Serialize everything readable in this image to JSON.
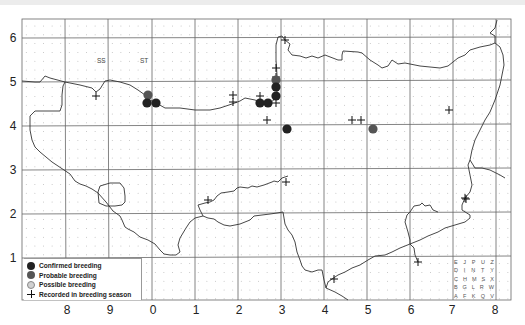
{
  "map": {
    "title": "Breeding distribution map",
    "square_labels": [
      {
        "text": "SS",
        "x": 97,
        "y": 57
      },
      {
        "text": "ST",
        "x": 140,
        "y": 57
      }
    ],
    "y_axis_labels": [
      {
        "text": "6",
        "y": 38
      },
      {
        "text": "5",
        "y": 82
      },
      {
        "text": "4",
        "y": 126
      },
      {
        "text": "3",
        "y": 170
      },
      {
        "text": "2",
        "y": 214
      },
      {
        "text": "1",
        "y": 258
      }
    ],
    "x_axis_labels": [
      {
        "text": "8",
        "x": 67
      },
      {
        "text": "9",
        "x": 110
      },
      {
        "text": "0",
        "x": 153
      },
      {
        "text": "1",
        "x": 196
      },
      {
        "text": "2",
        "x": 239
      },
      {
        "text": "3",
        "x": 282
      },
      {
        "text": "4",
        "x": 325
      },
      {
        "text": "5",
        "x": 368
      },
      {
        "text": "6",
        "x": 411
      },
      {
        "text": "7",
        "x": 452
      },
      {
        "text": "8",
        "x": 495
      }
    ],
    "colors": {
      "confirmed": "#222222",
      "probable": "#555555",
      "possible": "#c8c8c8",
      "grid": "#555555",
      "dots": "#bbbbbb",
      "coast": "#333333"
    }
  },
  "legend": {
    "items": [
      {
        "symbol": "filled-dark-circle",
        "label": "Confirmed breeding"
      },
      {
        "symbol": "filled-grey-circle",
        "label": "Probable breeding"
      },
      {
        "symbol": "light-grey-circle",
        "label": "Possible breeding"
      },
      {
        "symbol": "plus",
        "label": "Recorded in breeding season"
      }
    ]
  },
  "tetrad_key": {
    "rows": [
      [
        "E",
        "J",
        "P",
        "U",
        "Z"
      ],
      [
        "D",
        "I",
        "N",
        "T",
        "Y"
      ],
      [
        "C",
        "H",
        "M",
        "S",
        "X"
      ],
      [
        "B",
        "G",
        "L",
        "R",
        "W"
      ],
      [
        "A",
        "F",
        "K",
        "Q",
        "V"
      ]
    ]
  },
  "records": {
    "confirmed": [
      [
        147,
        103
      ],
      [
        156,
        103
      ],
      [
        260,
        103
      ],
      [
        268,
        103
      ],
      [
        276,
        96
      ],
      [
        276,
        87
      ],
      [
        287,
        129
      ]
    ],
    "probable": [
      [
        148,
        95
      ],
      [
        276,
        80
      ],
      [
        373,
        129
      ]
    ],
    "possible": [],
    "season": [
      [
        96,
        96
      ],
      [
        233,
        95
      ],
      [
        233,
        102
      ],
      [
        260,
        96
      ],
      [
        267,
        120
      ],
      [
        276,
        68
      ],
      [
        276,
        77
      ],
      [
        276,
        103
      ],
      [
        285,
        40
      ],
      [
        352,
        120
      ],
      [
        361,
        120
      ],
      [
        449,
        110
      ],
      [
        286,
        182
      ],
      [
        208,
        200
      ],
      [
        465,
        198
      ],
      [
        466,
        199
      ],
      [
        334,
        279
      ],
      [
        418,
        262
      ]
    ]
  }
}
